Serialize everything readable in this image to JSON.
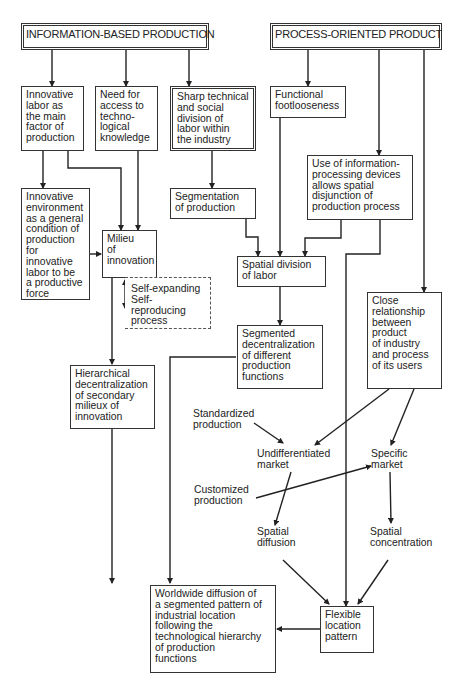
{
  "titles": {
    "info_based": "INFORMATION-BASED PRODUCTION",
    "process_oriented": "PROCESS-ORIENTED PRODUCT"
  },
  "boxes": {
    "innovative_labor": "Innovative\nlabor as\nthe main\nfactor of\nproduction",
    "need_access": "Need for\naccess to\ntechno-\nlogical\nknowledge",
    "sharp_division": "Sharp technical\nand social\ndivision of\nlabor within\nthe industry",
    "functional_footlooseness": "Functional\nfootlooseness",
    "info_devices": "Use of information-\nprocessing devices\nallows spatial\ndisjunction of\nproduction process",
    "innovative_environment": "Innovative\nenvironment\nas a general\ncondition of\nproduction\nfor innovative\nlabor to be\na productive\nforce",
    "segmentation": "Segmentation\nof production",
    "milieu": "Milieu\nof\ninnovation",
    "self_process": "Self-expanding\nSelf-reproducing\nprocess",
    "spatial_division": "Spatial division\nof labor",
    "segmented_decentralization": "Segmented\ndecentralization\nof different\nproduction\nfunctions",
    "close_relationship": "Close\nrelationship\nbetween\nproduct\nof industry\nand process\nof its users",
    "hierarchical_decentralization": "Hierarchical\ndecentralization\nof secondary\nmilieux of\ninnovation",
    "worldwide_diffusion": "Worldwide diffusion of\na segmented pattern of\nindustrial location\nfollowing the\ntechnological hierarchy\nof production\nfunctions",
    "flexible_location": "Flexible\nlocation\npattern"
  },
  "labels": {
    "standardized_production": "Standardized\nproduction",
    "undifferentiated_market": "Undifferentiated\nmarket",
    "specific_market": "Specific\nmarket",
    "customized_production": "Customized\nproduction",
    "spatial_diffusion": "Spatial\ndiffusion",
    "spatial_concentration": "Spatial\nconcentration"
  }
}
